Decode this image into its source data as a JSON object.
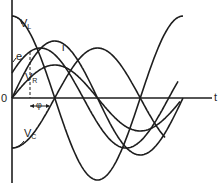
{
  "diagram": {
    "axis": {
      "origin_label": "0",
      "t_label": "t"
    },
    "labels": {
      "vl": {
        "main": "V",
        "sub": "L"
      },
      "e": "e",
      "i": "i",
      "vr": {
        "main": "V",
        "sub": "R"
      },
      "vc": {
        "main": "V",
        "sub": "C"
      },
      "phi": "φ"
    },
    "colors": {
      "line": "#1e1e1e",
      "background": "#ffffff"
    }
  },
  "chart_data": {
    "type": "line",
    "title": "",
    "xlabel": "t",
    "ylabel": "",
    "series": [
      {
        "name": "V_L",
        "form": "cos",
        "amplitude": 82,
        "phase_deg": 90
      },
      {
        "name": "i",
        "form": "sin",
        "amplitude": 57,
        "phase_deg": 0
      },
      {
        "name": "e",
        "form": "sin",
        "amplitude": 50,
        "phase_deg": 30
      },
      {
        "name": "V_R",
        "form": "sin",
        "amplitude": 33,
        "phase_deg": 0
      },
      {
        "name": "V_C",
        "form": "-cos",
        "amplitude": 50,
        "phase_deg": -90
      }
    ],
    "annotations": [
      "φ (phase difference between e and i)"
    ]
  }
}
